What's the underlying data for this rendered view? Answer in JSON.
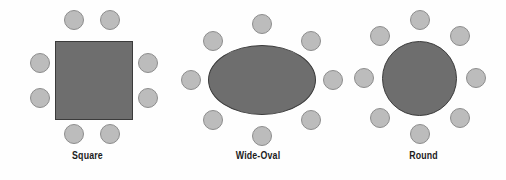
{
  "figure": {
    "title": "",
    "background_color": "#fefefe",
    "width": 506,
    "height": 180
  },
  "style": {
    "table_fill": "#6e6e6e",
    "table_stroke": "#3b3b3b",
    "chair_fill": "#bcbcbc",
    "chair_stroke": "#8d8d8d",
    "caption_color": "#1c1c1c",
    "chair_diameter": 20
  },
  "diagrams": [
    {
      "id": "square",
      "caption": "Square",
      "table_type": "square",
      "seat_count": 8,
      "caption_top": 150,
      "panel_left": 0,
      "panel_width": 175,
      "table": {
        "left": 55,
        "top": 41,
        "width": 78,
        "height": 79
      },
      "chairs": [
        {
          "left": 64,
          "top": 10,
          "position": "top-left"
        },
        {
          "left": 100,
          "top": 10,
          "position": "top-right"
        },
        {
          "left": 30,
          "top": 53,
          "position": "left-upper"
        },
        {
          "left": 30,
          "top": 88,
          "position": "left-lower"
        },
        {
          "left": 138,
          "top": 53,
          "position": "right-upper"
        },
        {
          "left": 138,
          "top": 88,
          "position": "right-lower"
        },
        {
          "left": 64,
          "top": 124,
          "position": "bottom-left"
        },
        {
          "left": 100,
          "top": 124,
          "position": "bottom-right"
        }
      ]
    },
    {
      "id": "wide-oval",
      "caption": "Wide-Oval",
      "table_type": "oval",
      "seat_count": 8,
      "caption_top": 150,
      "panel_left": 175,
      "panel_width": 166,
      "table": {
        "left": 208,
        "top": 45,
        "width": 108,
        "height": 70
      },
      "chairs": [
        {
          "left": 252,
          "top": 14,
          "position": "top-center"
        },
        {
          "left": 203,
          "top": 31,
          "position": "top-left"
        },
        {
          "left": 301,
          "top": 31,
          "position": "top-right"
        },
        {
          "left": 181,
          "top": 70,
          "position": "left-center"
        },
        {
          "left": 323,
          "top": 70,
          "position": "right-center"
        },
        {
          "left": 203,
          "top": 110,
          "position": "bottom-left"
        },
        {
          "left": 301,
          "top": 110,
          "position": "bottom-right"
        },
        {
          "left": 252,
          "top": 126,
          "position": "bottom-center"
        }
      ]
    },
    {
      "id": "round",
      "caption": "Round",
      "table_type": "round",
      "seat_count": 8,
      "caption_top": 150,
      "panel_left": 341,
      "panel_width": 165,
      "table": {
        "left": 382,
        "top": 41,
        "width": 75,
        "height": 75
      },
      "chairs": [
        {
          "left": 410,
          "top": 10,
          "position": "n"
        },
        {
          "left": 450,
          "top": 26,
          "position": "ne"
        },
        {
          "left": 466,
          "top": 68,
          "position": "e"
        },
        {
          "left": 450,
          "top": 108,
          "position": "se"
        },
        {
          "left": 410,
          "top": 124,
          "position": "s"
        },
        {
          "left": 370,
          "top": 108,
          "position": "sw"
        },
        {
          "left": 354,
          "top": 68,
          "position": "w"
        },
        {
          "left": 370,
          "top": 26,
          "position": "nw"
        }
      ]
    }
  ]
}
